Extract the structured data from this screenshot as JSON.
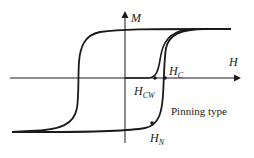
{
  "diagram": {
    "axes": {
      "y_label": "M",
      "x_label": "H"
    },
    "points": {
      "hc": {
        "main": "H",
        "sub": "C"
      },
      "hcw": {
        "main": "H",
        "sub": "CW"
      },
      "hn": {
        "main": "H",
        "sub": "N"
      }
    },
    "annotation": "Pinning type",
    "colors": {
      "line": "#1a1a1a",
      "background": "#ffffff"
    }
  }
}
